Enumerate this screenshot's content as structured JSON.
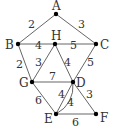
{
  "diagram": {
    "type": "weighted-graph",
    "vertices": [
      {
        "id": "A",
        "label": "A",
        "x": 56,
        "y": 14,
        "lx": 52,
        "ly": 10
      },
      {
        "id": "B",
        "label": "B",
        "x": 18,
        "y": 44,
        "lx": 5,
        "ly": 49
      },
      {
        "id": "H",
        "label": "H",
        "x": 55,
        "y": 44,
        "lx": 51,
        "ly": 40
      },
      {
        "id": "C",
        "label": "C",
        "x": 96,
        "y": 44,
        "lx": 100,
        "ly": 49
      },
      {
        "id": "G",
        "label": "G",
        "x": 32,
        "y": 82,
        "lx": 19,
        "ly": 87
      },
      {
        "id": "D",
        "label": "D",
        "x": 73,
        "y": 82,
        "lx": 76,
        "ly": 87
      },
      {
        "id": "E",
        "label": "E",
        "x": 56,
        "y": 114,
        "lx": 44,
        "ly": 123
      },
      {
        "id": "F",
        "label": "F",
        "x": 96,
        "y": 114,
        "lx": 100,
        "ly": 122
      }
    ],
    "edges": [
      {
        "from": "A",
        "to": "B",
        "weight": "2",
        "wx": 28,
        "wy": 28
      },
      {
        "from": "A",
        "to": "C",
        "weight": "3",
        "wx": 78,
        "wy": 28
      },
      {
        "from": "B",
        "to": "H",
        "weight": "4",
        "wx": 35,
        "wy": 49
      },
      {
        "from": "H",
        "to": "C",
        "weight": "5",
        "wx": 70,
        "wy": 49
      },
      {
        "from": "B",
        "to": "G",
        "weight": "2",
        "wx": 16,
        "wy": 68
      },
      {
        "from": "H",
        "to": "G",
        "weight": "3",
        "wx": 35,
        "wy": 66
      },
      {
        "from": "H",
        "to": "D",
        "weight": "4",
        "wx": 64,
        "wy": 66
      },
      {
        "from": "C",
        "to": "D",
        "weight": "5",
        "wx": 87,
        "wy": 66
      },
      {
        "from": "G",
        "to": "D",
        "weight": "7",
        "wx": 49,
        "wy": 80
      },
      {
        "from": "G",
        "to": "E",
        "weight": "6",
        "wx": 35,
        "wy": 104
      },
      {
        "from": "D",
        "to": "E",
        "weight": "4",
        "wx": 58,
        "wy": 98,
        "curve": false
      },
      {
        "from": "D",
        "to": "E",
        "weight": "4",
        "wx": 67,
        "wy": 106,
        "curve": true
      },
      {
        "from": "D",
        "to": "F",
        "weight": "3",
        "wx": 86,
        "wy": 98
      },
      {
        "from": "E",
        "to": "F",
        "weight": "6",
        "wx": 72,
        "wy": 126
      }
    ]
  }
}
